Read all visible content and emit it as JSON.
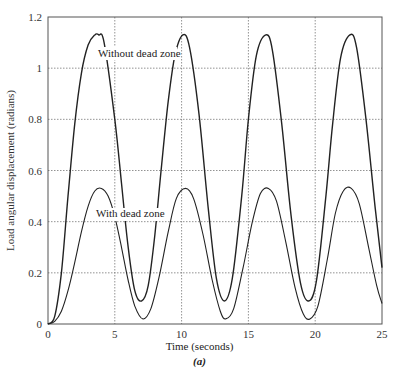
{
  "chart_data": {
    "type": "line",
    "title": "",
    "xlabel": "Time (seconds)",
    "ylabel": "Load angular displacement (radians)",
    "subfigure_label": "(a)",
    "xlim": [
      0,
      25
    ],
    "ylim": [
      0,
      1.2
    ],
    "xticks": [
      "0",
      "5",
      "10",
      "15",
      "20",
      "25"
    ],
    "yticks": [
      "0",
      "0.2",
      "0.4",
      "0.6",
      "0.8",
      "1",
      "1.2"
    ],
    "grid": true,
    "annotations": [
      "Without dead zone",
      "With dead zone"
    ],
    "series": [
      {
        "name": "Without dead zone",
        "x": [
          0,
          0.5,
          1,
          1.5,
          2,
          2.5,
          3,
          3.5,
          3.8,
          4.2,
          5,
          5.5,
          6,
          6.5,
          7,
          7.5,
          8,
          8.5,
          9,
          9.5,
          10.1,
          10.6,
          11.3,
          12,
          12.6,
          13.2,
          13.8,
          14.5,
          15,
          15.6,
          16.3,
          16.8,
          17.5,
          18.2,
          18.9,
          19.5,
          20.1,
          20.8,
          21.3,
          21.9,
          22.6,
          23.1,
          23.8,
          24.5,
          25
        ],
        "values": [
          0,
          0.03,
          0.2,
          0.5,
          0.78,
          0.98,
          1.09,
          1.13,
          1.13,
          1.1,
          0.8,
          0.55,
          0.3,
          0.13,
          0.09,
          0.15,
          0.35,
          0.62,
          0.87,
          1.05,
          1.13,
          1.08,
          0.82,
          0.45,
          0.18,
          0.09,
          0.18,
          0.5,
          0.8,
          1.05,
          1.13,
          1.07,
          0.78,
          0.42,
          0.16,
          0.09,
          0.17,
          0.5,
          0.78,
          1.04,
          1.13,
          1.08,
          0.8,
          0.45,
          0.22
        ]
      },
      {
        "name": "With dead zone",
        "x": [
          0,
          0.5,
          1,
          1.5,
          2,
          2.5,
          3,
          3.5,
          4,
          4.5,
          5,
          5.5,
          6,
          6.5,
          7.1,
          7.7,
          8.3,
          9,
          9.6,
          10.3,
          10.9,
          11.6,
          12.3,
          12.9,
          13.3,
          13.9,
          14.6,
          15.3,
          15.9,
          16.5,
          17.1,
          17.8,
          18.5,
          19.1,
          19.6,
          20.2,
          20.9,
          21.5,
          22.1,
          22.7,
          23.3,
          24,
          24.6,
          25
        ],
        "values": [
          0,
          0.01,
          0.05,
          0.13,
          0.24,
          0.36,
          0.46,
          0.52,
          0.53,
          0.5,
          0.42,
          0.3,
          0.17,
          0.07,
          0.02,
          0.06,
          0.18,
          0.36,
          0.49,
          0.53,
          0.49,
          0.35,
          0.17,
          0.05,
          0.02,
          0.06,
          0.22,
          0.4,
          0.51,
          0.53,
          0.48,
          0.32,
          0.14,
          0.04,
          0.02,
          0.07,
          0.25,
          0.43,
          0.52,
          0.53,
          0.47,
          0.3,
          0.15,
          0.08
        ]
      }
    ]
  },
  "labels": {
    "xlabel": "Time (seconds)",
    "ylabel": "Load angular displacement (radians)",
    "subfig": "(a)",
    "ann_without": "Without dead zone",
    "ann_with": "With dead zone"
  }
}
